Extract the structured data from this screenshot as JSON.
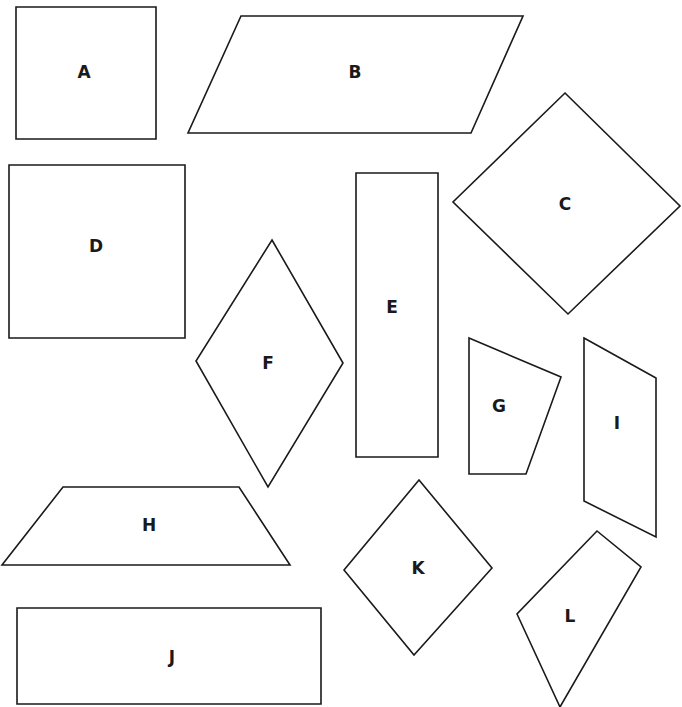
{
  "canvas": {
    "width": 682,
    "height": 707,
    "background": "#ffffff",
    "stroke": "#1a1a1a"
  },
  "shapes": [
    {
      "id": "A",
      "label": "A",
      "type": "square",
      "points": [
        [
          16,
          7
        ],
        [
          156,
          7
        ],
        [
          156,
          139
        ],
        [
          16,
          139
        ]
      ],
      "label_pos": [
        84,
        72
      ]
    },
    {
      "id": "B",
      "label": "B",
      "type": "parallelogram",
      "points": [
        [
          241,
          16
        ],
        [
          523,
          16
        ],
        [
          471,
          133
        ],
        [
          188,
          133
        ]
      ],
      "label_pos": [
        355,
        72
      ]
    },
    {
      "id": "C",
      "label": "C",
      "type": "square (rotated)",
      "points": [
        [
          565,
          93
        ],
        [
          680,
          206
        ],
        [
          568,
          314
        ],
        [
          453,
          202
        ]
      ],
      "label_pos": [
        565,
        204
      ]
    },
    {
      "id": "D",
      "label": "D",
      "type": "square",
      "points": [
        [
          9,
          165
        ],
        [
          185,
          165
        ],
        [
          185,
          338
        ],
        [
          9,
          338
        ]
      ],
      "label_pos": [
        96,
        246
      ]
    },
    {
      "id": "E",
      "label": "E",
      "type": "rectangle",
      "points": [
        [
          356,
          173
        ],
        [
          438,
          173
        ],
        [
          438,
          457
        ],
        [
          356,
          457
        ]
      ],
      "label_pos": [
        392,
        307
      ]
    },
    {
      "id": "F",
      "label": "F",
      "type": "rhombus",
      "points": [
        [
          272,
          240
        ],
        [
          343,
          363
        ],
        [
          268,
          487
        ],
        [
          196,
          361
        ]
      ],
      "label_pos": [
        268,
        363
      ]
    },
    {
      "id": "G",
      "label": "G",
      "type": "trapezoid",
      "points": [
        [
          469,
          338
        ],
        [
          561,
          377
        ],
        [
          526,
          474
        ],
        [
          469,
          474
        ]
      ],
      "label_pos": [
        499,
        406
      ]
    },
    {
      "id": "H",
      "label": "H",
      "type": "trapezoid",
      "points": [
        [
          63,
          487
        ],
        [
          239,
          487
        ],
        [
          290,
          565
        ],
        [
          2,
          565
        ]
      ],
      "label_pos": [
        149,
        525
      ]
    },
    {
      "id": "I",
      "label": "I",
      "type": "parallelogram",
      "points": [
        [
          584,
          338
        ],
        [
          656,
          378
        ],
        [
          656,
          537
        ],
        [
          584,
          501
        ]
      ],
      "label_pos": [
        617,
        423
      ]
    },
    {
      "id": "J",
      "label": "J",
      "type": "rectangle",
      "points": [
        [
          17,
          608
        ],
        [
          321,
          608
        ],
        [
          321,
          704
        ],
        [
          17,
          704
        ]
      ],
      "label_pos": [
        172,
        657
      ]
    },
    {
      "id": "K",
      "label": "K",
      "type": "square (rotated)",
      "points": [
        [
          419,
          480
        ],
        [
          492,
          568
        ],
        [
          414,
          655
        ],
        [
          344,
          570
        ]
      ],
      "label_pos": [
        418,
        568
      ]
    },
    {
      "id": "L",
      "label": "L",
      "type": "quadrilateral",
      "points": [
        [
          597,
          531
        ],
        [
          641,
          567
        ],
        [
          560,
          707
        ],
        [
          517,
          614
        ]
      ],
      "label_pos": [
        570,
        616
      ]
    }
  ]
}
